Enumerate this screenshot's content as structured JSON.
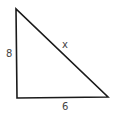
{
  "diagram": {
    "type": "right-triangle",
    "vertices": {
      "top": [
        16,
        9
      ],
      "bottom_left": [
        17,
        98
      ],
      "bottom_right": [
        108,
        97
      ]
    },
    "labels": {
      "vertical_side": "8",
      "hypotenuse": "x",
      "horizontal_side": "6"
    },
    "colors": {
      "stroke": "#1a1a1a",
      "label": "#444444",
      "background": "#ffffff"
    }
  }
}
